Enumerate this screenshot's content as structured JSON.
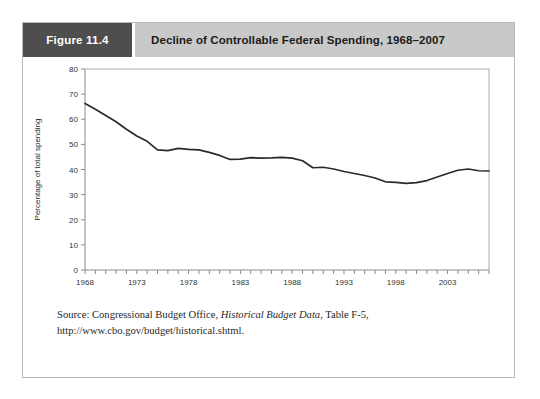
{
  "figure": {
    "number_label": "Figure 11.4",
    "title": "Decline of Controllable Federal Spending, 1968–2007"
  },
  "source": {
    "prefix": "Source: Congressional Budget Office, ",
    "italic_title": "Historical Budget Data",
    "suffix": ", Table F-5, http://www.cbo.gov/budget/historical.shtml."
  },
  "colors": {
    "figure_number_bg": "#4e4e4e",
    "title_bg": "#c9c9c9",
    "line": "#2a2a2a",
    "frame": "#b9b9b9",
    "axis": "#8a8a8a"
  },
  "chart_data": {
    "type": "line",
    "title": "Decline of Controllable Federal Spending, 1968–2007",
    "xlabel": "",
    "ylabel": "Percentage of total spending",
    "xlim": [
      1968,
      2007
    ],
    "ylim": [
      0,
      80
    ],
    "yticks": [
      0,
      10,
      20,
      30,
      40,
      50,
      60,
      70,
      80
    ],
    "ytick_labels": [
      "0",
      "10",
      "20",
      "30",
      "40",
      "50",
      "60",
      "70",
      "80"
    ],
    "xtick_labels": [
      "1968",
      "1973",
      "1978",
      "1983",
      "1988",
      "1993",
      "1998",
      "2003"
    ],
    "xtick_values": [
      1968,
      1973,
      1978,
      1983,
      1988,
      1993,
      1998,
      2003
    ],
    "xtick_every": 1,
    "grid": false,
    "legend": false,
    "series": [
      {
        "name": "Controllable federal spending",
        "x": [
          1968,
          1969,
          1970,
          1971,
          1972,
          1973,
          1974,
          1975,
          1976,
          1977,
          1978,
          1979,
          1980,
          1981,
          1982,
          1983,
          1984,
          1985,
          1986,
          1987,
          1988,
          1989,
          1990,
          1991,
          1992,
          1993,
          1994,
          1995,
          1996,
          1997,
          1998,
          1999,
          2000,
          2001,
          2002,
          2003,
          2004,
          2005,
          2006,
          2007
        ],
        "values": [
          66.3,
          64.0,
          61.5,
          59.0,
          56.0,
          53.3,
          51.2,
          47.8,
          47.5,
          48.4,
          48.0,
          47.8,
          46.8,
          45.6,
          44.0,
          44.1,
          44.7,
          44.5,
          44.6,
          44.8,
          44.5,
          43.5,
          40.7,
          40.9,
          40.2,
          39.2,
          38.4,
          37.6,
          36.6,
          35.1,
          34.9,
          34.5,
          34.8,
          35.6,
          37.0,
          38.4,
          39.7,
          40.2,
          39.5,
          39.4
        ]
      }
    ]
  }
}
